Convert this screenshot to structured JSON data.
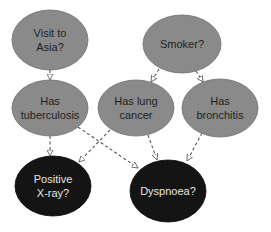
{
  "diagram": {
    "type": "bayesian-network",
    "colors": {
      "background": "#ffffff",
      "cause_node_fill": "#8a8a8a",
      "cause_node_text": "#1f1f1f",
      "observed_node_fill": "#141414",
      "observed_node_text": "#e6e6e6",
      "edge": "#555555"
    },
    "nodes": [
      {
        "id": "asia",
        "lines": [
          "Visit to",
          "Asia?"
        ],
        "cx": 50,
        "cy": 40,
        "rx": 38,
        "ry": 30,
        "kind": "cause"
      },
      {
        "id": "smoker",
        "lines": [
          "Smoker?"
        ],
        "cx": 182,
        "cy": 44,
        "rx": 39,
        "ry": 29,
        "kind": "cause"
      },
      {
        "id": "tuberculosis",
        "lines": [
          "Has",
          "tuberculosis"
        ],
        "cx": 50,
        "cy": 108,
        "rx": 38,
        "ry": 28,
        "kind": "cause"
      },
      {
        "id": "lung_cancer",
        "lines": [
          "Has lung",
          "cancer"
        ],
        "cx": 136,
        "cy": 108,
        "rx": 38,
        "ry": 28,
        "kind": "cause"
      },
      {
        "id": "bronchitis",
        "lines": [
          "Has",
          "bronchitis"
        ],
        "cx": 220,
        "cy": 108,
        "rx": 38,
        "ry": 29,
        "kind": "cause"
      },
      {
        "id": "xray",
        "lines": [
          "Positive",
          "X-ray?"
        ],
        "cx": 53,
        "cy": 186,
        "rx": 38,
        "ry": 30,
        "kind": "observed"
      },
      {
        "id": "dyspnoea",
        "lines": [
          "Dyspnoea?"
        ],
        "cx": 168,
        "cy": 191,
        "rx": 38,
        "ry": 31,
        "kind": "observed"
      }
    ],
    "edges": [
      {
        "from": "asia",
        "to": "tuberculosis",
        "x1": 50,
        "y1": 70,
        "x2": 50,
        "y2": 80
      },
      {
        "from": "smoker",
        "to": "lung_cancer",
        "x1": 159,
        "y1": 69,
        "x2": 151,
        "y2": 82
      },
      {
        "from": "smoker",
        "to": "bronchitis",
        "x1": 196,
        "y1": 71,
        "x2": 203,
        "y2": 82
      },
      {
        "from": "tuberculosis",
        "to": "xray",
        "x1": 50,
        "y1": 136,
        "x2": 50,
        "y2": 156
      },
      {
        "from": "tuberculosis",
        "to": "dyspnoea",
        "x1": 78,
        "y1": 127,
        "x2": 138,
        "y2": 168
      },
      {
        "from": "lung_cancer",
        "to": "xray",
        "x1": 110,
        "y1": 130,
        "x2": 79,
        "y2": 162
      },
      {
        "from": "lung_cancer",
        "to": "dyspnoea",
        "x1": 148,
        "y1": 135,
        "x2": 157,
        "y2": 160
      },
      {
        "from": "bronchitis",
        "to": "dyspnoea",
        "x1": 202,
        "y1": 133,
        "x2": 187,
        "y2": 161
      }
    ]
  }
}
